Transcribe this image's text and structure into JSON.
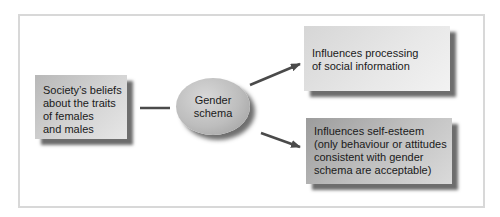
{
  "diagram": {
    "source_box": {
      "lines": [
        "Society’s beliefs",
        "about the traits",
        "of females",
        "and males"
      ]
    },
    "center_node": {
      "lines": [
        "Gender",
        "schema"
      ]
    },
    "outcome_top": {
      "lines": [
        "Influences processing",
        "of social information"
      ]
    },
    "outcome_bottom": {
      "lines": [
        "Influences self-esteem",
        "(only behaviour or attitudes",
        "consistent with gender",
        "schema are acceptable)"
      ]
    },
    "connectors": [
      {
        "from": "source_box",
        "to": "center_node",
        "type": "line"
      },
      {
        "from": "center_node",
        "to": "outcome_top",
        "type": "arrow"
      },
      {
        "from": "center_node",
        "to": "outcome_bottom",
        "type": "arrow"
      }
    ],
    "colors": {
      "frame_border": "#d8d8d8",
      "connector": "#4a4a4a",
      "box_light": "#e8e8e8",
      "box_dark": "#b0b0b0"
    }
  }
}
